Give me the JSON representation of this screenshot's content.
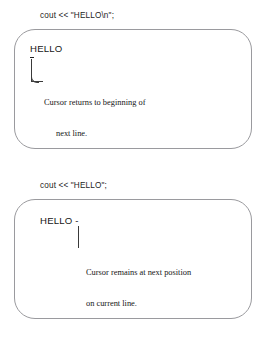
{
  "figure": {
    "background_color": "#ffffff",
    "box_border_color": "#9a9a9e",
    "text_color": "#161616"
  },
  "panels": [
    {
      "id": "newline-panel",
      "caption": "cout << \"HELLO\\n\";",
      "output_text": "HELLO",
      "cursor_marker": "-",
      "cursor_position": "beginning-of-next-line",
      "annotation_line_1": "Cursor returns to beginning of",
      "annotation_line_2": "next line."
    },
    {
      "id": "no-newline-panel",
      "caption": "cout << \"HELLO\";",
      "output_text": "HELLO -",
      "cursor_marker": "-",
      "cursor_position": "next-position-on-current-line",
      "annotation_line_1": "Cursor remains at next position",
      "annotation_line_2": "on current line."
    }
  ]
}
